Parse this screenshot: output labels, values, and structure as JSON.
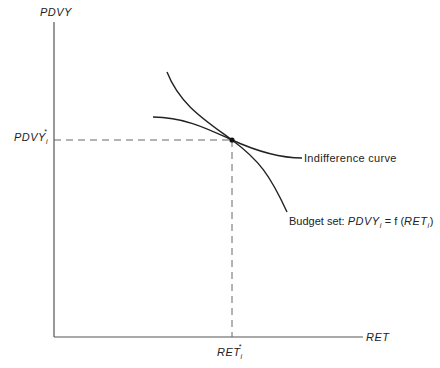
{
  "axes": {
    "y_label": "PDVY",
    "x_label": "RET",
    "y_star_label": "PDVY",
    "y_star_sub": "i",
    "y_star_sup": "*",
    "x_star_label": "RET",
    "x_star_sub": "i",
    "x_star_sup": "*"
  },
  "curves": {
    "indifference_label": "Indifference curve",
    "budget_label_prefix": "Budget set: ",
    "budget_eq_lhs": "PDVY",
    "budget_eq_lhs_sub": "i",
    "budget_eq_mid": " = f (",
    "budget_eq_arg": "RET",
    "budget_eq_arg_sub": "i",
    "budget_eq_end": ")"
  },
  "colors": {
    "line": "#222222",
    "axis": "#555555"
  }
}
